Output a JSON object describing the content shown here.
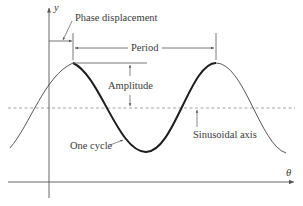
{
  "diagram": {
    "axes": {
      "x_label": "θ",
      "y_label": "y"
    },
    "annotations": {
      "phase_displacement": "Phase displacement",
      "period": "Period",
      "amplitude": "Amplitude",
      "one_cycle": "One cycle",
      "sinusoidal_axis": "Sinusoidal axis"
    },
    "colors": {
      "curve": "#2a2a2a",
      "axes": "#555555",
      "dashed_axis": "#9a9a9a",
      "text": "#3a3a3a"
    }
  }
}
